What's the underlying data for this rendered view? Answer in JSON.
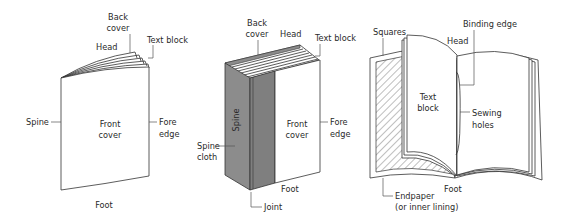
{
  "diagram": {
    "figures": [
      {
        "id": "pamphlet",
        "labels": {
          "back_cover_1": "Back",
          "back_cover_2": "cover",
          "head": "Head",
          "text_block": "Text block",
          "spine": "Spine",
          "front_cover_1": "Front",
          "front_cover_2": "cover",
          "fore_edge_1": "Fore",
          "fore_edge_2": "edge",
          "foot": "Foot"
        }
      },
      {
        "id": "hardcover",
        "labels": {
          "back_cover_1": "Back",
          "back_cover_2": "cover",
          "head": "Head",
          "text_block": "Text block",
          "spine": "Spine",
          "spine_cloth_1": "Spine",
          "spine_cloth_2": "cloth",
          "front_cover_1": "Front",
          "front_cover_2": "cover",
          "fore_edge_1": "Fore",
          "fore_edge_2": "edge",
          "foot": "Foot",
          "joint": "Joint"
        },
        "colors": {
          "spine_cloth": "#8c8c8c",
          "spine_cloth_dark": "#7a7a7a"
        }
      },
      {
        "id": "open-book",
        "labels": {
          "squares": "Squares",
          "binding_edge": "Binding edge",
          "head": "Head",
          "text_block_1": "Text",
          "text_block_2": "block",
          "sewing_holes_1": "Sewing",
          "sewing_holes_2": "holes",
          "foot": "Foot",
          "endpaper_1": "Endpaper",
          "endpaper_2": "(or inner lining)"
        }
      }
    ]
  }
}
